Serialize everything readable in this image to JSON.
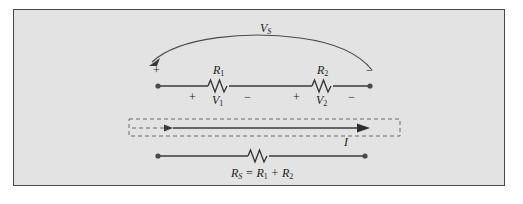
{
  "figure": {
    "background_color": "#e3e3e3",
    "border_color": "#4a4a4a",
    "line_color": "#3a3a3a"
  },
  "source_branch": {
    "source_label": "V",
    "source_sub": "S",
    "left_terminal_sign": "+",
    "right_terminal_sign": "−",
    "resistors": [
      {
        "name": "R",
        "sub": "1",
        "voltage_label": "V",
        "voltage_sub": "1",
        "plus": "+",
        "minus": "−"
      },
      {
        "name": "R",
        "sub": "2",
        "voltage_label": "V",
        "voltage_sub": "2",
        "plus": "+",
        "minus": "−"
      }
    ]
  },
  "current": {
    "label": "I"
  },
  "equivalent_branch": {
    "equation": "R",
    "equation_sub": "S",
    "equation_rest_1": " = R",
    "equation_sub_1": "1",
    "equation_plus": " + R",
    "equation_sub_2": "2"
  }
}
